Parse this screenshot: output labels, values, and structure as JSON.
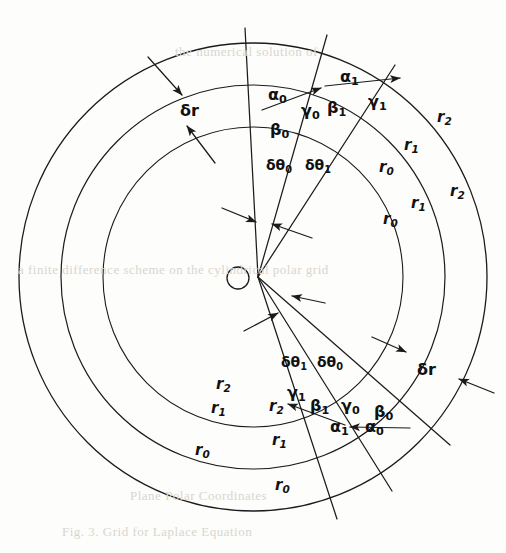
{
  "figure": {
    "type": "polar-coordinate-grid-diagram",
    "center": {
      "x": 253,
      "y": 277
    },
    "vertex": {
      "x": 258,
      "y": 277
    },
    "hole": {
      "cx": 238,
      "cy": 278,
      "r": 11
    },
    "arcs": [
      {
        "name": "r0-arc",
        "radius": 150
      },
      {
        "name": "r1-arc",
        "radius": 192
      },
      {
        "name": "r2-arc",
        "radius": 234
      }
    ],
    "rays": [
      {
        "name": "ray-upper-0",
        "angle_deg": -93
      },
      {
        "name": "ray-upper-1",
        "angle_deg": -74
      },
      {
        "name": "ray-upper-2",
        "angle_deg": -57
      },
      {
        "name": "ray-lower-0",
        "angle_deg": 72
      },
      {
        "name": "ray-lower-1",
        "angle_deg": 57
      },
      {
        "name": "ray-lower-2",
        "angle_deg": 40
      }
    ],
    "stroke_color": "#1b1b1b",
    "background_color": "#fdfdfb"
  },
  "labels": {
    "delta_r": "δr",
    "radius": {
      "r0": {
        "base": "r",
        "sub": "0"
      },
      "r1": {
        "base": "r",
        "sub": "1"
      },
      "r2": {
        "base": "r",
        "sub": "2"
      }
    },
    "angles": {
      "alpha0": {
        "base": "α",
        "sub": "0"
      },
      "alpha1": {
        "base": "α",
        "sub": "1"
      },
      "beta0": {
        "base": "β",
        "sub": "0"
      },
      "beta1": {
        "base": "β",
        "sub": "1"
      },
      "gamma0": {
        "base": "γ",
        "sub": "0"
      },
      "gamma1": {
        "base": "γ",
        "sub": "1"
      }
    },
    "delta_theta": {
      "dtheta0": {
        "base": "δθ",
        "sub": "0"
      },
      "dtheta1": {
        "base": "δθ",
        "sub": "1"
      }
    }
  },
  "placed_labels": [
    {
      "name": "label-delta-r-top-left",
      "kind": "dr",
      "text": "δr",
      "x": 180,
      "y": 103
    },
    {
      "name": "label-delta-r-bottom-right",
      "kind": "dr",
      "text": "δr",
      "x": 417,
      "y": 362
    },
    {
      "name": "label-alpha0-top",
      "kind": "g",
      "base": "α",
      "sub": "0",
      "x": 268,
      "y": 87
    },
    {
      "name": "label-alpha1-top",
      "kind": "g",
      "base": "α",
      "sub": "1",
      "x": 340,
      "y": 69
    },
    {
      "name": "label-beta0-top",
      "kind": "g",
      "base": "β",
      "sub": "0",
      "x": 270,
      "y": 122
    },
    {
      "name": "label-beta1-top",
      "kind": "g",
      "base": "β",
      "sub": "1",
      "x": 327,
      "y": 100
    },
    {
      "name": "label-gamma0-top",
      "kind": "g",
      "base": "γ",
      "sub": "0",
      "x": 301,
      "y": 103
    },
    {
      "name": "label-gamma1-top",
      "kind": "g",
      "base": "γ",
      "sub": "1",
      "x": 368,
      "y": 94
    },
    {
      "name": "label-dtheta0-top",
      "kind": "dth",
      "base": "δθ",
      "sub": "0",
      "x": 266,
      "y": 158
    },
    {
      "name": "label-dtheta1-top",
      "kind": "dth",
      "base": "δθ",
      "sub": "1",
      "x": 305,
      "y": 158
    },
    {
      "name": "label-r0-upper-inner",
      "kind": "r",
      "base": "r",
      "sub": "0",
      "x": 379,
      "y": 160
    },
    {
      "name": "label-r1-upper-mid",
      "kind": "r",
      "base": "r",
      "sub": "1",
      "x": 404,
      "y": 138
    },
    {
      "name": "label-r2-upper-outer",
      "kind": "r",
      "base": "r",
      "sub": "2",
      "x": 437,
      "y": 110
    },
    {
      "name": "label-r0-right-inner",
      "kind": "r",
      "base": "r",
      "sub": "0",
      "x": 383,
      "y": 212
    },
    {
      "name": "label-r1-right-mid",
      "kind": "r",
      "base": "r",
      "sub": "1",
      "x": 411,
      "y": 196
    },
    {
      "name": "label-r2-right-outer",
      "kind": "r",
      "base": "r",
      "sub": "2",
      "x": 450,
      "y": 184
    },
    {
      "name": "label-dtheta1-bottom",
      "kind": "dth",
      "base": "δθ",
      "sub": "1",
      "x": 281,
      "y": 355
    },
    {
      "name": "label-dtheta0-bottom",
      "kind": "dth",
      "base": "δθ",
      "sub": "0",
      "x": 317,
      "y": 355
    },
    {
      "name": "label-gamma1-bottom",
      "kind": "g",
      "base": "γ",
      "sub": "1",
      "x": 287,
      "y": 385
    },
    {
      "name": "label-beta1-bottom",
      "kind": "g",
      "base": "β",
      "sub": "1",
      "x": 310,
      "y": 398
    },
    {
      "name": "label-gamma0-bottom",
      "kind": "g",
      "base": "γ",
      "sub": "0",
      "x": 341,
      "y": 398
    },
    {
      "name": "label-beta0-bottom",
      "kind": "g",
      "base": "β",
      "sub": "0",
      "x": 374,
      "y": 404
    },
    {
      "name": "label-alpha1-bottom",
      "kind": "g",
      "base": "α",
      "sub": "1",
      "x": 330,
      "y": 419
    },
    {
      "name": "label-alpha0-bottom",
      "kind": "g",
      "base": "α",
      "sub": "0",
      "x": 365,
      "y": 419
    },
    {
      "name": "label-r2-lower-left",
      "kind": "r",
      "base": "r",
      "sub": "2",
      "x": 216,
      "y": 377
    },
    {
      "name": "label-r2-lower-inner",
      "kind": "r",
      "base": "r",
      "sub": "2",
      "x": 269,
      "y": 399
    },
    {
      "name": "label-r1-lower-left",
      "kind": "r",
      "base": "r",
      "sub": "1",
      "x": 211,
      "y": 401
    },
    {
      "name": "label-r1-lower-mid",
      "kind": "r",
      "base": "r",
      "sub": "1",
      "x": 272,
      "y": 433
    },
    {
      "name": "label-r0-lower-left",
      "kind": "r",
      "base": "r",
      "sub": "0",
      "x": 195,
      "y": 443
    },
    {
      "name": "label-r0-lower-outer",
      "kind": "r",
      "base": "r",
      "sub": "0",
      "x": 275,
      "y": 478
    }
  ],
  "bleed_text": [
    {
      "name": "bleed-line-top",
      "text": "the numerical solution of",
      "x": 175,
      "y": 44
    },
    {
      "name": "bleed-line-middle",
      "text": "a  finite  difference  scheme  on  the  cylindrical  polar  grid",
      "x": 18,
      "y": 262
    },
    {
      "name": "bleed-line-lower",
      "text": "Plane  Polar  Coordinates",
      "x": 130,
      "y": 488
    },
    {
      "name": "bleed-line-bottom",
      "text": "Fig. 3.  Grid for Laplace Equation",
      "x": 62,
      "y": 524
    }
  ]
}
